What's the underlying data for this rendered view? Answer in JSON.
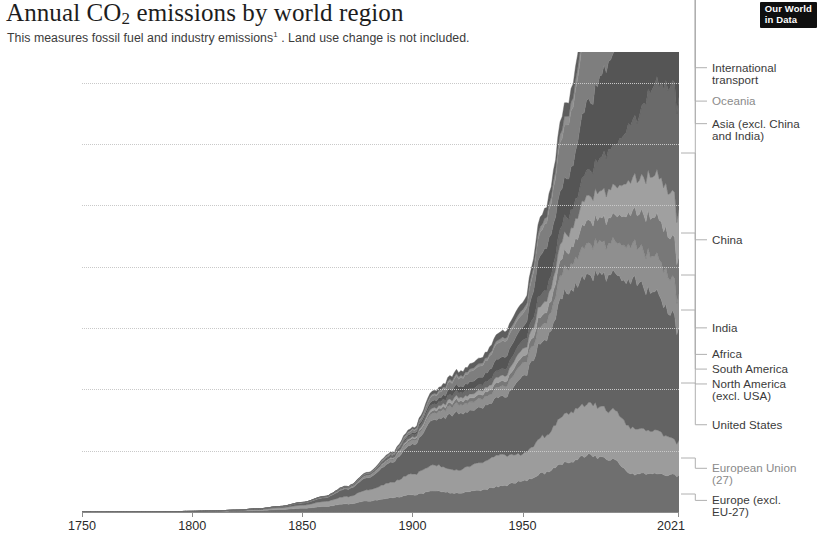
{
  "header": {
    "title_main": "Annual CO",
    "title_sub": "2",
    "title_rest": " emissions by world region",
    "subtitle_before": "This measures fossil fuel and industry emissions",
    "subtitle_footnote": "1",
    "subtitle_after": " . Land use change is not included.",
    "logo_line1": "Our World",
    "logo_line2": "in Data"
  },
  "chart_data": {
    "type": "area",
    "stacked": true,
    "title": "Annual CO2 emissions by world region",
    "subtitle": "This measures fossil fuel and industry emissions. Land use change is not included.",
    "xlabel": "",
    "ylabel": "",
    "xlim": [
      1750,
      2021
    ],
    "ylim": [
      0,
      37.5
    ],
    "grid": true,
    "legend_position": "right-direct-labels",
    "y_ticks": [
      {
        "value": 0,
        "label": "0 t"
      },
      {
        "value": 5,
        "label": "5 billion t"
      },
      {
        "value": 10,
        "label": "10 billion t"
      },
      {
        "value": 15,
        "label": "15 billion t"
      },
      {
        "value": 20,
        "label": "20 billion t"
      },
      {
        "value": 25,
        "label": "25 billion t"
      },
      {
        "value": 30,
        "label": "30 billion t"
      },
      {
        "value": 35,
        "label": "35 billion t"
      }
    ],
    "x_ticks": [
      {
        "value": 1750,
        "label": "1750"
      },
      {
        "value": 1800,
        "label": "1800"
      },
      {
        "value": 1850,
        "label": "1850"
      },
      {
        "value": 1900,
        "label": "1900"
      },
      {
        "value": 1950,
        "label": "1950"
      },
      {
        "value": 2021,
        "label": "2021"
      }
    ],
    "x": [
      1750,
      1760,
      1770,
      1780,
      1790,
      1800,
      1810,
      1820,
      1830,
      1840,
      1850,
      1860,
      1870,
      1880,
      1890,
      1900,
      1910,
      1920,
      1930,
      1940,
      1950,
      1960,
      1970,
      1980,
      1990,
      2000,
      2010,
      2015,
      2019,
      2020,
      2021
    ],
    "series": [
      {
        "name": "Europe (excl. EU-27)",
        "color": "#6f6f6f",
        "values": [
          0.0,
          0.0,
          0.01,
          0.01,
          0.02,
          0.03,
          0.05,
          0.08,
          0.12,
          0.2,
          0.3,
          0.45,
          0.65,
          0.9,
          1.15,
          1.4,
          1.7,
          1.55,
          1.75,
          2.1,
          2.5,
          3.2,
          4.1,
          4.6,
          4.3,
          3.1,
          3.15,
          3.0,
          3.0,
          2.85,
          3.0
        ]
      },
      {
        "name": "European Union (27)",
        "color": "#9c9c9c",
        "values": [
          0.0,
          0.0,
          0.0,
          0.01,
          0.01,
          0.02,
          0.03,
          0.05,
          0.09,
          0.15,
          0.25,
          0.4,
          0.6,
          0.9,
          1.25,
          1.7,
          2.1,
          1.9,
          2.2,
          2.55,
          2.2,
          3.0,
          4.0,
          4.25,
          4.0,
          3.75,
          3.5,
          3.2,
          2.9,
          2.7,
          2.85
        ]
      },
      {
        "name": "United States",
        "color": "#636363",
        "values": [
          0.0,
          0.0,
          0.0,
          0.0,
          0.0,
          0.0,
          0.01,
          0.02,
          0.04,
          0.08,
          0.18,
          0.3,
          0.6,
          1.0,
          1.6,
          2.4,
          3.7,
          4.6,
          4.4,
          4.6,
          6.3,
          7.9,
          9.9,
          10.5,
          11.0,
          12.1,
          11.2,
          10.4,
          10.0,
          9.0,
          9.5
        ]
      },
      {
        "name": "North America (excl. USA)",
        "color": "#8f8f8f",
        "values": [
          0.0,
          0.0,
          0.0,
          0.0,
          0.0,
          0.0,
          0.0,
          0.0,
          0.01,
          0.01,
          0.02,
          0.04,
          0.07,
          0.12,
          0.2,
          0.32,
          0.55,
          0.7,
          0.7,
          0.8,
          1.05,
          1.4,
          2.0,
          2.5,
          2.6,
          2.9,
          3.0,
          2.95,
          2.9,
          2.6,
          2.75
        ]
      },
      {
        "name": "South America",
        "color": "#787878",
        "values": [
          0.0,
          0.0,
          0.0,
          0.0,
          0.0,
          0.0,
          0.0,
          0.0,
          0.0,
          0.01,
          0.01,
          0.02,
          0.03,
          0.05,
          0.09,
          0.14,
          0.22,
          0.3,
          0.34,
          0.4,
          0.55,
          0.85,
          1.35,
          1.9,
          2.05,
          2.6,
          3.25,
          3.3,
          3.3,
          3.05,
          3.15
        ]
      },
      {
        "name": "Africa",
        "color": "#a0a0a0",
        "values": [
          0.0,
          0.0,
          0.0,
          0.0,
          0.0,
          0.0,
          0.0,
          0.0,
          0.0,
          0.0,
          0.01,
          0.01,
          0.02,
          0.04,
          0.07,
          0.12,
          0.2,
          0.28,
          0.34,
          0.45,
          0.6,
          0.9,
          1.4,
          2.0,
          2.3,
          2.7,
          3.4,
          3.6,
          3.75,
          3.55,
          3.7
        ]
      },
      {
        "name": "India",
        "color": "#6a6a6a",
        "values": [
          0.0,
          0.0,
          0.0,
          0.0,
          0.0,
          0.0,
          0.0,
          0.0,
          0.0,
          0.0,
          0.01,
          0.02,
          0.04,
          0.07,
          0.12,
          0.2,
          0.32,
          0.4,
          0.45,
          0.55,
          0.7,
          0.95,
          1.4,
          2.1,
          3.2,
          4.6,
          7.2,
          8.2,
          9.2,
          8.6,
          9.3
        ]
      },
      {
        "name": "China",
        "color": "#555555",
        "values": [
          0.0,
          0.0,
          0.0,
          0.0,
          0.0,
          0.0,
          0.0,
          0.0,
          0.0,
          0.0,
          0.0,
          0.01,
          0.02,
          0.04,
          0.08,
          0.15,
          0.3,
          0.5,
          0.6,
          0.95,
          1.1,
          3.4,
          3.1,
          5.6,
          7.4,
          9.0,
          19.5,
          22.0,
          23.5,
          23.8,
          24.3
        ]
      },
      {
        "name": "Asia (excl. China and India)",
        "color": "#7e7e7e",
        "values": [
          0.0,
          0.0,
          0.0,
          0.0,
          0.0,
          0.0,
          0.0,
          0.0,
          0.0,
          0.0,
          0.0,
          0.01,
          0.02,
          0.05,
          0.1,
          0.2,
          0.4,
          0.65,
          0.9,
          1.3,
          1.1,
          2.0,
          4.4,
          6.0,
          8.0,
          9.5,
          12.5,
          13.8,
          14.3,
          13.6,
          14.2
        ]
      },
      {
        "name": "Oceania",
        "color": "#909090",
        "values": [
          0.0,
          0.0,
          0.0,
          0.0,
          0.0,
          0.0,
          0.0,
          0.0,
          0.0,
          0.0,
          0.0,
          0.01,
          0.02,
          0.03,
          0.06,
          0.09,
          0.14,
          0.18,
          0.2,
          0.25,
          0.33,
          0.45,
          0.7,
          0.9,
          1.05,
          1.3,
          1.5,
          1.5,
          1.45,
          1.4,
          1.42
        ]
      },
      {
        "name": "International transport",
        "color": "#5e5e5e",
        "values": [
          0.0,
          0.0,
          0.0,
          0.0,
          0.0,
          0.0,
          0.0,
          0.0,
          0.0,
          0.0,
          0.0,
          0.01,
          0.02,
          0.04,
          0.08,
          0.14,
          0.25,
          0.35,
          0.45,
          0.55,
          0.6,
          0.8,
          1.1,
          1.3,
          1.35,
          1.55,
          1.9,
          2.05,
          2.2,
          1.5,
          1.7
        ]
      }
    ],
    "annotations": [
      {
        "label": "International\ntransport",
        "series": "International transport"
      },
      {
        "label": "Oceania",
        "series": "Oceania"
      },
      {
        "label": "Asia (excl. China\nand India)",
        "series": "Asia (excl. China and India)"
      },
      {
        "label": "China",
        "series": "China"
      },
      {
        "label": "India",
        "series": "India"
      },
      {
        "label": "Africa",
        "series": "Africa"
      },
      {
        "label": "South America",
        "series": "South America"
      },
      {
        "label": "North America\n(excl. USA)",
        "series": "North America (excl. USA)"
      },
      {
        "label": "United States",
        "series": "United States"
      },
      {
        "label": "European Union\n(27)",
        "series": "European Union (27)"
      },
      {
        "label": "Europe (excl.\nEU-27)",
        "series": "Europe (excl. EU-27)"
      }
    ]
  }
}
